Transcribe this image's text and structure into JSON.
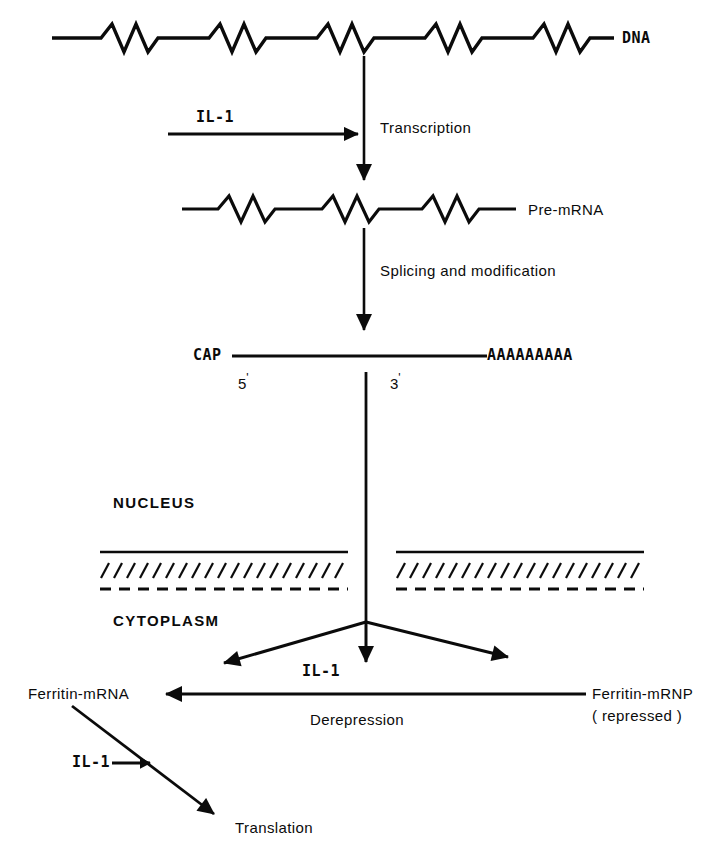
{
  "figure": {
    "ink_color": "#0b0b0b",
    "background_color": "#ffffff",
    "width": 708,
    "height": 859
  },
  "labels": {
    "dna": "DNA",
    "pre_mrna": "Pre-mRNA",
    "transcription": "Transcription",
    "splicing": "Splicing and modification",
    "cap": "CAP",
    "poly_a": "AAAAAAAAA",
    "five_prime": "5",
    "three_prime": "3",
    "prime_mark": "'",
    "nucleus": "NUCLEUS",
    "cytoplasm": "CYTOPLASM",
    "il1_transcription": "IL-1",
    "il1_export": "IL-1",
    "il1_translation": "IL-1",
    "ferritin_mrna": "Ferritin-mRNA",
    "ferritin_mrnp": "Ferritin-mRNP",
    "ferritin_mrnp_state": "( repressed )",
    "derepression": "Derepression",
    "translation": "Translation"
  },
  "strands": {
    "dna": {
      "name": "dna-strand",
      "y": 38,
      "x_start": 52,
      "x_end": 614,
      "zigzag_groups": 5,
      "peaks_per_group": 2,
      "amplitude": 14
    },
    "pre_mrna": {
      "name": "pre-mrna-strand",
      "y": 209,
      "x_start": 182,
      "x_end": 516,
      "zigzag_groups": 3,
      "peaks_per_group": 2,
      "amplitude": 13
    },
    "mature_mrna": {
      "name": "mature-mrna-strand",
      "y": 356,
      "x_start": 232,
      "x_end": 487
    }
  },
  "nuclear_membrane": {
    "name": "nuclear-envelope",
    "solid_line_y": 552,
    "hatch_line_y": 570,
    "dashed_line_y": 588,
    "left_segment": {
      "x_start": 100,
      "x_end": 348
    },
    "right_segment": {
      "x_start": 396,
      "x_end": 644
    },
    "hatch_count_left": 19,
    "hatch_count_right": 19
  },
  "arrows": {
    "transcription": {
      "name": "transcription-arrow",
      "x": 364,
      "y_start": 56,
      "y_end": 190
    },
    "il1_to_transcription": {
      "name": "il1-transcription-arrow",
      "y": 134,
      "x_start": 168,
      "x_end": 362
    },
    "splicing": {
      "name": "splicing-arrow",
      "x": 364,
      "y_start": 228,
      "y_end": 340
    },
    "export": {
      "name": "nuclear-export-arrow",
      "x": 366,
      "y_start": 372,
      "y_end": 622
    },
    "branch_center": {
      "name": "il1-release-arrow",
      "x": 366,
      "y_start": 622,
      "y_end": 678
    },
    "branch_left": {
      "name": "branch-left-arrow",
      "x_start": 366,
      "y_start": 622,
      "x_end": 212,
      "y_end": 667
    },
    "branch_right": {
      "name": "branch-right-arrow",
      "x_start": 366,
      "y_start": 622,
      "x_end": 523,
      "y_end": 662
    },
    "derepression": {
      "name": "derepression-arrow",
      "y": 694,
      "x_start": 586,
      "x_end": 150
    },
    "translation": {
      "name": "translation-arrow",
      "x_start": 72,
      "y_start": 706,
      "x_end": 222,
      "y_end": 820
    },
    "il1_to_translation": {
      "name": "il1-translation-arrow",
      "y": 763,
      "x_start": 112,
      "x_end": 158
    }
  }
}
